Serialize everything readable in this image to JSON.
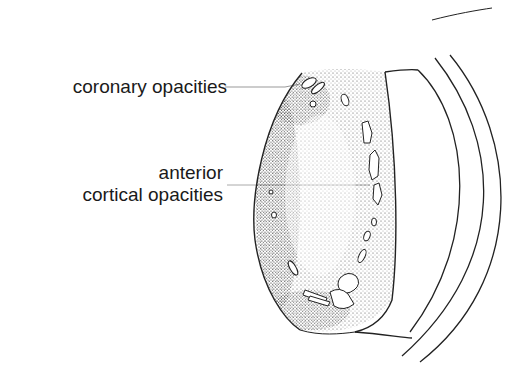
{
  "figure": {
    "labels": [
      {
        "id": "coronary",
        "text": "coronary opacities"
      },
      {
        "id": "anterior_line1",
        "text": "anterior"
      },
      {
        "id": "anterior_line2",
        "text": "cortical opacities"
      }
    ]
  }
}
